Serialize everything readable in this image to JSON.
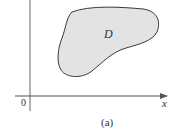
{
  "figure": {
    "caption": "(a)",
    "region_label": "D",
    "origin_label": "0",
    "x_axis_label": "x",
    "colors": {
      "axis": "#555555",
      "region_fill": "#e3e3e3",
      "region_stroke": "#3a3a3a",
      "text": "#333333"
    }
  }
}
